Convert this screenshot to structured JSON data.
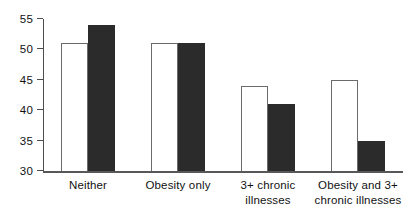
{
  "chart_data": {
    "type": "bar",
    "title": "",
    "subtitle": "",
    "xlabel": "",
    "ylabel": "",
    "ylim": [
      30,
      55
    ],
    "yticks": [
      30,
      35,
      40,
      45,
      50,
      55
    ],
    "ytick_labels": [
      "30",
      "35",
      "40",
      "45",
      "50",
      "55"
    ],
    "grid": false,
    "legend": "none",
    "categories": [
      "Neither",
      "Obesity only",
      "3+ chronic illnesses",
      "Obesity and 3+ chronic illnesses"
    ],
    "category_label_lines": [
      [
        "Neither"
      ],
      [
        "Obesity only"
      ],
      [
        "3+ chronic",
        "illnesses"
      ],
      [
        "Obesity and 3+",
        "chronic illnesses"
      ]
    ],
    "series": [
      {
        "name": "open",
        "style": "white-filled-black-outline",
        "color": "#ffffff",
        "edge_color": "#6b6b6b",
        "values": [
          51,
          51,
          44,
          45
        ]
      },
      {
        "name": "filled",
        "style": "solid-black",
        "color": "#2b2b2b",
        "edge_color": "#2b2b2b",
        "values": [
          54,
          51,
          41,
          35
        ]
      }
    ],
    "axis_color": "#4d4d4d",
    "background": "#ffffff"
  }
}
